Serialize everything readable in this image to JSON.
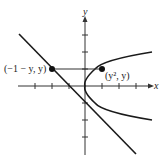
{
  "diagram": {
    "x_axis_label": "x",
    "y_axis_label": "y",
    "left_point_label": "(−1 − y, y)",
    "right_point_label": "(y², y)",
    "curves": [
      "x = y² (parabola)",
      "x = −1 − y (line)"
    ],
    "segment": "horizontal segment from (−1 − y, y) to (y², y)",
    "colors": {
      "stroke": "#1a1a1a"
    }
  }
}
